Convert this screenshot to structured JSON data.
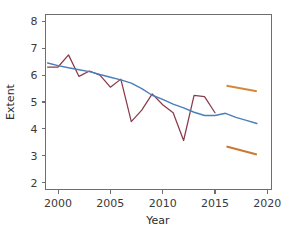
{
  "chart_data": {
    "type": "line",
    "title": "",
    "xlabel": "Year",
    "ylabel": "Extent",
    "xlim": [
      1998.8,
      2020.4
    ],
    "ylim": [
      1.75,
      8.25
    ],
    "xticks": [
      2000,
      2005,
      2010,
      2015,
      2020
    ],
    "xtick_labels": [
      "2000",
      "2005",
      "2010",
      "2015",
      "2020"
    ],
    "yticks": [
      2,
      3,
      4,
      5,
      6,
      7,
      8
    ],
    "ytick_labels": [
      "2",
      "3",
      "4",
      "5",
      "6",
      "7",
      "8"
    ],
    "grid": false,
    "legend": "none",
    "series": [
      {
        "name": "observed-extent",
        "color": "#8b3a4a",
        "type": "line",
        "x": [
          1999,
          2000,
          2001,
          2002,
          2003,
          2004,
          2005,
          2006,
          2007,
          2008,
          2009,
          2010,
          2011,
          2012,
          2013,
          2014,
          2015
        ],
        "values": [
          6.3,
          6.3,
          6.75,
          5.95,
          6.15,
          6.0,
          5.55,
          5.85,
          4.27,
          4.7,
          5.3,
          4.9,
          4.6,
          3.57,
          5.25,
          5.2,
          4.6
        ]
      },
      {
        "name": "trend-fit",
        "color": "#4a7ebb",
        "type": "line",
        "x": [
          1999,
          2000,
          2001,
          2002,
          2003,
          2004,
          2005,
          2006,
          2007,
          2008,
          2009,
          2010,
          2011,
          2012,
          2013,
          2014,
          2015,
          2016,
          2017,
          2018,
          2019
        ],
        "values": [
          6.45,
          6.35,
          6.27,
          6.2,
          6.13,
          6.02,
          5.92,
          5.82,
          5.7,
          5.5,
          5.25,
          5.1,
          4.92,
          4.78,
          4.62,
          4.5,
          4.5,
          4.58,
          4.43,
          4.32,
          4.2
        ]
      },
      {
        "name": "projection-upper",
        "color": "#d4883a",
        "type": "line",
        "x": [
          2016.1,
          2019.0
        ],
        "values": [
          5.6,
          5.4
        ]
      },
      {
        "name": "projection-lower",
        "color": "#c87a33",
        "type": "line",
        "x": [
          2016.1,
          2019.0
        ],
        "values": [
          3.35,
          3.05
        ]
      }
    ]
  },
  "axes": {
    "y_title": "Extent",
    "x_title": "Year"
  },
  "colors": {
    "observed": "#8b3a4a",
    "trend": "#4a7ebb",
    "projection": "#d4883a",
    "axis": "#6e6e6e",
    "background": "#ffffff"
  }
}
